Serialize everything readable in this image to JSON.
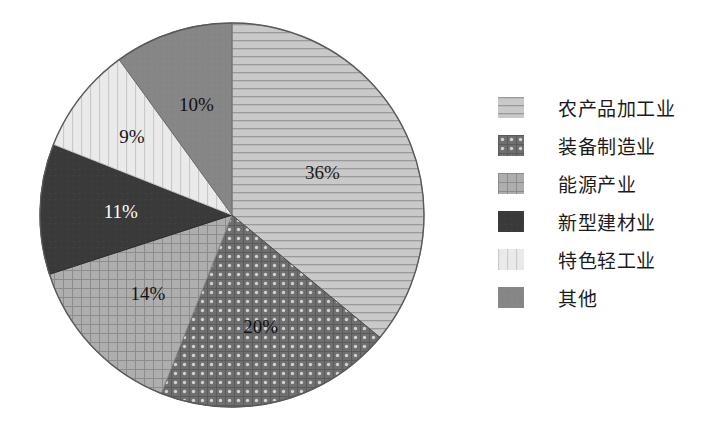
{
  "chart_data": {
    "type": "pie",
    "title": "",
    "subtitle": "",
    "xlabel": "",
    "ylabel": "",
    "legend_position": "right",
    "grid": false,
    "units": "percent",
    "categories": [
      "农产品加工业",
      "装备制造业",
      "能源产业",
      "新型建材业",
      "特色轻工业",
      "其他"
    ],
    "values": [
      36,
      20,
      14,
      11,
      9,
      10
    ],
    "data_labels": [
      "36%",
      "20%",
      "14%",
      "11%",
      "9%",
      "10%"
    ],
    "slices": [
      {
        "label": "农产品加工业",
        "value": 36,
        "data_label": "36%",
        "pattern": "horizontal-lines",
        "fill": "#c9c9c9",
        "stroke": "#8f8f8f",
        "label_color": "#1a1a1a"
      },
      {
        "label": "装备制造业",
        "value": 20,
        "data_label": "20%",
        "pattern": "dots-grid-dark",
        "fill": "#6f6f6f",
        "stroke": "#4a4a4a",
        "label_color": "#111111"
      },
      {
        "label": "能源产业",
        "value": 14,
        "data_label": "14%",
        "pattern": "fine-grid",
        "fill": "#aeaeae",
        "stroke": "#8a8a8a",
        "label_color": "#141414"
      },
      {
        "label": "新型建材业",
        "value": 11,
        "data_label": "11%",
        "pattern": "solid-dark",
        "fill": "#3a3a3a",
        "stroke": "#2a2a2a",
        "label_color": "#ffffff"
      },
      {
        "label": "特色轻工业",
        "value": 9,
        "data_label": "9%",
        "pattern": "vertical-lines-light",
        "fill": "#e8e8e8",
        "stroke": "#c4c4c4",
        "label_color": "#141414"
      },
      {
        "label": "其他",
        "value": 10,
        "data_label": "10%",
        "pattern": "solid-medium",
        "fill": "#868686",
        "stroke": "#6a6a6a",
        "label_color": "#101010"
      }
    ]
  },
  "legend": {
    "items": [
      {
        "label": "农产品加工业",
        "pattern": "horizontal-lines"
      },
      {
        "label": "装备制造业",
        "pattern": "dots-grid-dark"
      },
      {
        "label": "能源产业",
        "pattern": "fine-grid"
      },
      {
        "label": "新型建材业",
        "pattern": "solid-dark"
      },
      {
        "label": "特色轻工业",
        "pattern": "vertical-lines-light"
      },
      {
        "label": "其他",
        "pattern": "solid-medium"
      }
    ]
  },
  "colors": {
    "background": "#ffffff",
    "outline": "#555555",
    "text": "#1b1b1b"
  }
}
